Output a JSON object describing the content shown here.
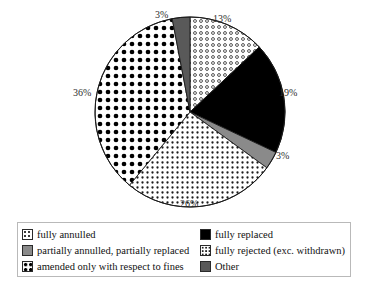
{
  "chart_data": {
    "type": "pie",
    "title": "",
    "subtitle": "",
    "xlabel": "",
    "ylabel": "",
    "legend_position": "bottom",
    "grid": false,
    "start_angle_deg": 0,
    "direction": "clockwise",
    "unit": "%",
    "categories": [
      "fully annulled",
      "fully replaced",
      "partially annulled, partially replaced",
      "fully rejected (exc. withdrawn)",
      "amended only with respect to fines",
      "Other"
    ],
    "values": [
      13,
      19,
      3,
      26,
      36,
      3
    ],
    "slices": [
      {
        "key": "fully-annulled",
        "label": "fully annulled",
        "value": 13,
        "value_label": "13%",
        "pattern": "open-circles",
        "fill": "#ffffff",
        "ink": "#3a3a3a",
        "start_deg": 0,
        "end_deg": 46.8
      },
      {
        "key": "fully-replaced",
        "label": "fully replaced",
        "value": 19,
        "value_label": "19%",
        "pattern": "solid",
        "fill": "#000000",
        "ink": "#000000",
        "start_deg": 46.8,
        "end_deg": 115.2
      },
      {
        "key": "partially-annulled-partially-replaced",
        "label": "partially annulled, partially replaced",
        "value": 3,
        "value_label": "3%",
        "pattern": "solid",
        "fill": "#8a8a8a",
        "ink": "#8a8a8a",
        "start_deg": 115.2,
        "end_deg": 126.0
      },
      {
        "key": "fully-rejected",
        "label": "fully rejected (exc. withdrawn)",
        "value": 26,
        "value_label": "26%",
        "pattern": "fine-dots",
        "fill": "#ffffff",
        "ink": "#222222",
        "start_deg": 126.0,
        "end_deg": 219.6
      },
      {
        "key": "amended-only-with-respect-to-fines",
        "label": "amended only with respect to fines",
        "value": 36,
        "value_label": "36%",
        "pattern": "big-dots",
        "fill": "#ffffff",
        "ink": "#000000",
        "start_deg": 219.6,
        "end_deg": 349.2
      },
      {
        "key": "other",
        "label": "Other",
        "value": 3,
        "value_label": "3%",
        "pattern": "solid",
        "fill": "#595959",
        "ink": "#595959",
        "start_deg": 349.2,
        "end_deg": 360.0
      }
    ],
    "value_labels": [
      {
        "key": "label-13",
        "text": "13%",
        "x": 213,
        "y": 13
      },
      {
        "key": "label-19",
        "text": "19%",
        "x": 279,
        "y": 87
      },
      {
        "key": "label-3-partial",
        "text": "3%",
        "x": 276,
        "y": 150
      },
      {
        "key": "label-26",
        "text": "26%",
        "x": 180,
        "y": 198
      },
      {
        "key": "label-36",
        "text": "36%",
        "x": 73,
        "y": 87
      },
      {
        "key": "label-3-other",
        "text": "3%",
        "x": 155,
        "y": 9
      }
    ]
  },
  "legend": {
    "items": [
      {
        "key": "fully-annulled",
        "label": "fully annulled",
        "pattern": "open-circles",
        "column": 0,
        "row": 0
      },
      {
        "key": "fully-replaced",
        "label": "fully replaced",
        "pattern": "solid-black",
        "column": 1,
        "row": 0
      },
      {
        "key": "partially-annulled-partially-replaced",
        "label": "partially annulled, partially replaced",
        "pattern": "gray",
        "column": 0,
        "row": 1
      },
      {
        "key": "fully-rejected",
        "label": "fully rejected (exc. withdrawn)",
        "pattern": "fine-dots",
        "column": 1,
        "row": 1
      },
      {
        "key": "amended-only-with-respect-to-fines",
        "label": "amended only with respect to fines",
        "pattern": "big-dots",
        "column": 0,
        "row": 2
      },
      {
        "key": "other",
        "label": "Other",
        "pattern": "dark-gray",
        "column": 1,
        "row": 2
      }
    ]
  },
  "colors": {
    "solid_black": "#000000",
    "gray": "#8a8a8a",
    "dark_gray": "#595959",
    "ink": "#111111",
    "legend_border": "#b9b9b9",
    "pie_outline": "#1a1a1a",
    "background": "#ffffff"
  }
}
